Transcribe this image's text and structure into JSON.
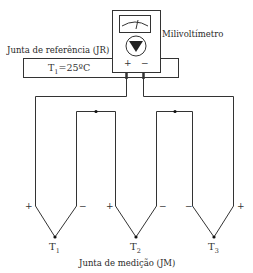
{
  "diagram": {
    "meter_label": "Milivoltímetro",
    "reference_junction_label": "Junta de referência (JR)",
    "reference_temperature": {
      "symbol": "T",
      "subscript": "1",
      "value": "=25ºC"
    },
    "meter_terminals": {
      "positive": "+",
      "negative": "−"
    },
    "measurement_junction_label": "Junta de medição (JM)",
    "thermocouples": [
      {
        "symbol": "T",
        "subscript": "1",
        "left_polarity": "+",
        "right_polarity": "−"
      },
      {
        "symbol": "T",
        "subscript": "2",
        "left_polarity": "+",
        "right_polarity": "−"
      },
      {
        "symbol": "T",
        "subscript": "3",
        "left_polarity": "−",
        "right_polarity": "+"
      }
    ],
    "colors": {
      "line": "#333333",
      "background": "#ffffff"
    }
  }
}
